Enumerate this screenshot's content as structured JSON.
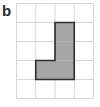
{
  "figure": {
    "label": "b",
    "grid": {
      "columns": 4,
      "rows": 5
    },
    "shaded_cells": [
      {
        "col": 3,
        "row": 2
      },
      {
        "col": 3,
        "row": 3
      },
      {
        "col": 3,
        "row": 4
      },
      {
        "col": 2,
        "row": 4
      }
    ],
    "colors": {
      "grid_line": "#d6d6d6",
      "shape_fill": "#a6a6a6",
      "shape_outline": "#2e2e2e",
      "label": "#2b2b2b"
    }
  }
}
